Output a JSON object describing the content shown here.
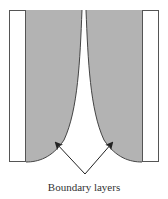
{
  "diagram": {
    "label": "Boundary layers",
    "colors": {
      "fill": "#b3b3b3",
      "stroke": "#444444",
      "plate": "#ffffff"
    },
    "elements": [
      "left-plate",
      "right-plate",
      "left-boundary-layer",
      "right-boundary-layer",
      "arrow-left",
      "arrow-right"
    ]
  }
}
